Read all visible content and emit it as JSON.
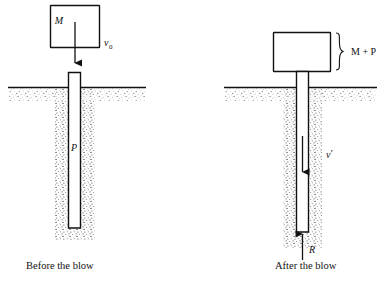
{
  "figure": {
    "title": "",
    "panels": [
      {
        "id": "before",
        "caption": "Before the blow",
        "hammer_label": "M",
        "velocity_label": "v",
        "velocity_sub": "0",
        "pile_label": "P",
        "reaction_label": "",
        "brace_label": ""
      },
      {
        "id": "after",
        "caption": "After the blow",
        "hammer_label": "",
        "velocity_label": "v",
        "velocity_sub": "′",
        "pile_label": "",
        "reaction_label": "R",
        "brace_label": "M + P"
      }
    ]
  },
  "colors": {
    "ink": "#111111",
    "paper": "#ffffff",
    "soil": "#7a7a7a"
  }
}
